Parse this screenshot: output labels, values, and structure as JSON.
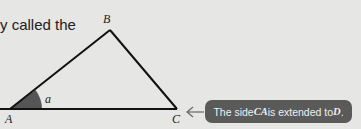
{
  "intro_text": "y called the",
  "diagram": {
    "vertices": [
      {
        "name": "A",
        "label": "A"
      },
      {
        "name": "B",
        "label": "B"
      },
      {
        "name": "C",
        "label": "C"
      }
    ],
    "angle_label": "a",
    "angle_fill": "#555555",
    "line_color": "#111111"
  },
  "callout": {
    "text_prefix": "The side ",
    "segment": "CA",
    "text_middle": " is extended to ",
    "point": "D",
    "text_suffix": ".",
    "background": "#5a5a5a"
  }
}
